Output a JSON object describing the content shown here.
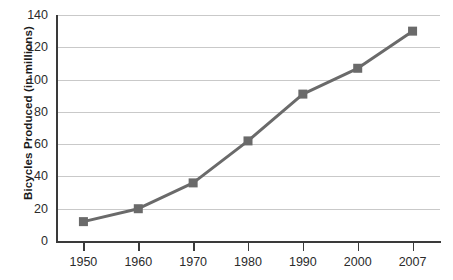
{
  "chart_data": {
    "type": "line",
    "title": "",
    "xlabel": "",
    "ylabel": "Bicycles Produced (in millions)",
    "categories": [
      "1950",
      "1960",
      "1970",
      "1980",
      "1990",
      "2000",
      "2007"
    ],
    "x": [
      1950,
      1960,
      1970,
      1980,
      1990,
      2000,
      2007
    ],
    "values": [
      12,
      20,
      36,
      62,
      91,
      107,
      130
    ],
    "series": [
      {
        "name": "Bicycles Produced",
        "values": [
          12,
          20,
          36,
          62,
          91,
          107,
          130
        ]
      }
    ],
    "ylim": [
      0,
      140
    ],
    "yticks": [
      0,
      20,
      40,
      60,
      80,
      100,
      120,
      140
    ],
    "ytick_labels": [
      "0",
      "20",
      "40",
      "60",
      "80",
      "100",
      "120",
      "140"
    ],
    "grid": true,
    "grid_axis": "y",
    "legend": false,
    "legend_position": "none",
    "marker": "square",
    "colors": {
      "line": "#6a6a6a",
      "marker": "#6a6a6a",
      "grid": "#c9c9c9",
      "axis": "#3a3a3a",
      "text": "#2b2b2b",
      "background": "#ffffff"
    }
  }
}
